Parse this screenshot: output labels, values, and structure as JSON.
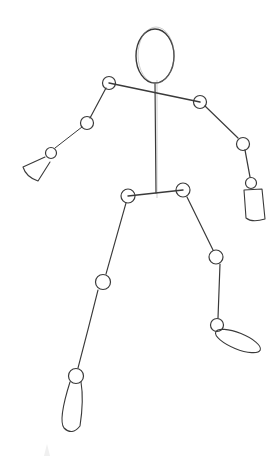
{
  "image": {
    "subject": "pencil sketch of a stick figure mannequin",
    "background_color": "#ffffff",
    "stroke_color": "#3a3a3a"
  },
  "figure": {
    "parts": [
      "head",
      "spine",
      "shoulders",
      "left-arm",
      "right-arm",
      "left-hand",
      "right-hand",
      "hips",
      "left-leg",
      "right-leg",
      "left-foot",
      "right-foot"
    ]
  }
}
